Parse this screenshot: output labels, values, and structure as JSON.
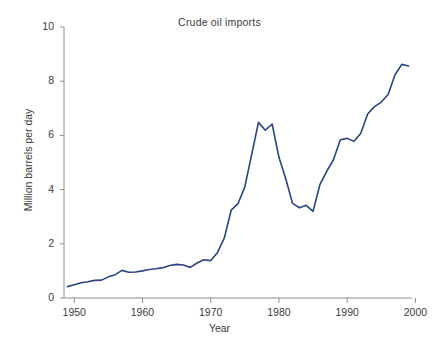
{
  "chart_data": {
    "type": "line",
    "title": "Crude oil imports",
    "xlabel": "Year",
    "ylabel": "Million barrels per day",
    "xlim": [
      1948.5,
      1999.5
    ],
    "ylim": [
      0,
      10
    ],
    "grid": false,
    "legend": false,
    "line_color": "#2a4480",
    "line_width": 1.6,
    "xticks": [
      1950,
      1960,
      1970,
      1980,
      1990,
      2000
    ],
    "xtick_labels": [
      "1950",
      "1960",
      "1970",
      "1980",
      "1990",
      "2000"
    ],
    "yticks": [
      0,
      2,
      4,
      6,
      8,
      10
    ],
    "ytick_labels": [
      "0",
      "2",
      "4",
      "6",
      "8",
      "10"
    ],
    "series": [
      {
        "name": "Crude oil imports",
        "x": [
          1949,
          1950,
          1951,
          1952,
          1953,
          1954,
          1955,
          1956,
          1957,
          1958,
          1959,
          1960,
          1961,
          1962,
          1963,
          1964,
          1965,
          1966,
          1967,
          1968,
          1969,
          1970,
          1971,
          1972,
          1973,
          1974,
          1975,
          1976,
          1977,
          1978,
          1979,
          1980,
          1981,
          1982,
          1983,
          1984,
          1985,
          1986,
          1987,
          1988,
          1989,
          1990,
          1991,
          1992,
          1993,
          1994,
          1995,
          1996,
          1997,
          1998,
          1999
        ],
        "values": [
          0.42,
          0.49,
          0.56,
          0.6,
          0.65,
          0.66,
          0.78,
          0.86,
          1.02,
          0.95,
          0.96,
          1.0,
          1.05,
          1.08,
          1.12,
          1.2,
          1.24,
          1.22,
          1.13,
          1.29,
          1.41,
          1.38,
          1.68,
          2.22,
          3.24,
          3.48,
          4.1,
          5.29,
          6.48,
          6.19,
          6.42,
          5.19,
          4.4,
          3.49,
          3.33,
          3.42,
          3.2,
          4.18,
          4.67,
          5.11,
          5.84,
          5.89,
          5.78,
          6.08,
          6.79,
          7.06,
          7.23,
          7.51,
          8.23,
          8.62,
          8.56
        ]
      }
    ]
  },
  "axes_geometry": {
    "left_px": 64,
    "right_px": 412,
    "top_px": 27,
    "bottom_px": 298
  }
}
